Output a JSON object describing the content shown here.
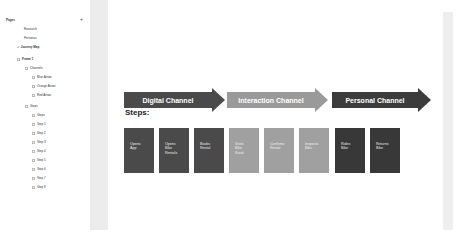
{
  "sidebar": {
    "pages_label": "Pages",
    "add_page_icon": "plus-icon",
    "pages": [
      {
        "label": "Research"
      },
      {
        "label": "Personas"
      },
      {
        "label": "Journey Map",
        "active": true
      }
    ],
    "layers": [
      {
        "label": "Frame 1",
        "indent": 0,
        "icon": "frame-icon"
      },
      {
        "label": "Channels",
        "indent": 1,
        "icon": "group-icon"
      },
      {
        "label": "Blue Arrow",
        "indent": 2,
        "icon": "shape-icon"
      },
      {
        "label": "Orange Arrow",
        "indent": 2,
        "icon": "shape-icon"
      },
      {
        "label": "Red Arrow",
        "indent": 2,
        "icon": "shape-icon"
      },
      {
        "label": "Steps",
        "indent": 1,
        "icon": "group-icon"
      },
      {
        "label": "Steps",
        "indent": 2,
        "icon": "text-icon"
      },
      {
        "label": "Step 1",
        "indent": 2,
        "icon": "shape-icon"
      },
      {
        "label": "Step 2",
        "indent": 2,
        "icon": "shape-icon"
      },
      {
        "label": "Step 3",
        "indent": 2,
        "icon": "shape-icon"
      },
      {
        "label": "Step 4",
        "indent": 2,
        "icon": "shape-icon"
      },
      {
        "label": "Step 5",
        "indent": 2,
        "icon": "shape-icon"
      },
      {
        "label": "Step 6",
        "indent": 2,
        "icon": "shape-icon"
      },
      {
        "label": "Step 7",
        "indent": 2,
        "icon": "shape-icon"
      },
      {
        "label": "Step 8",
        "indent": 2,
        "icon": "shape-icon"
      }
    ]
  },
  "canvas": {
    "channels": [
      {
        "label": "Digital Channel",
        "color": "#4a4a4a"
      },
      {
        "label": "Interaction Channel",
        "color": "#9a9a9a"
      },
      {
        "label": "Personal Channel",
        "color": "#3c3c3c"
      }
    ],
    "steps_title": "Steps:",
    "steps": [
      {
        "label": "Opens\nApp",
        "color": "#4a4a4a"
      },
      {
        "label": "Opens\nBike\nRentals",
        "color": "#4a4a4a"
      },
      {
        "label": "Books\nRental",
        "color": "#4a4a4a"
      },
      {
        "label": "Visits\nBike\nKiosk",
        "color": "#a0a0a0"
      },
      {
        "label": "Confirms\nRental",
        "color": "#a0a0a0"
      },
      {
        "label": "Inspects\nBike",
        "color": "#a0a0a0"
      },
      {
        "label": "Rides\nBike",
        "color": "#383838"
      },
      {
        "label": "Returns\nBike",
        "color": "#383838"
      }
    ]
  }
}
